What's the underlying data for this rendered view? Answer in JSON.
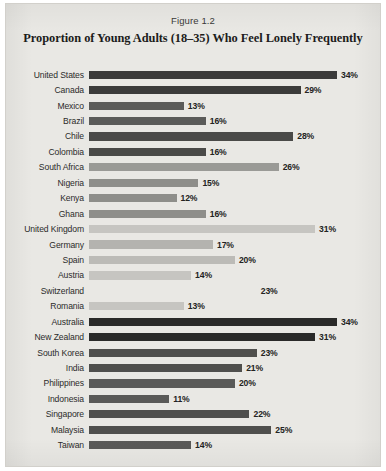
{
  "figure": {
    "number_label": "Figure 1.2",
    "title": "Proportion of Young Adults (18–35) Who Feel Lonely Frequently"
  },
  "chart_data": {
    "type": "bar",
    "orientation": "horizontal",
    "title": "Proportion of Young Adults (18–35) Who Feel Lonely Frequently",
    "subtitle": "Figure 1.2",
    "xlabel": "",
    "ylabel": "",
    "xlim": [
      0,
      34
    ],
    "grid": false,
    "legend": "none",
    "value_suffix": "%",
    "value_labels_shown": true,
    "axis_max_value": 34,
    "categories": [
      "United States",
      "Canada",
      "Mexico",
      "Brazil",
      "Chile",
      "Colombia",
      "South Africa",
      "Nigeria",
      "Kenya",
      "Ghana",
      "United Kingdom",
      "Germany",
      "Spain",
      "Austria",
      "Switzerland",
      "Romania",
      "Australia",
      "New Zealand",
      "South Korea",
      "India",
      "Philippines",
      "Indonesia",
      "Singapore",
      "Malaysia",
      "Taiwan"
    ],
    "values": [
      34,
      29,
      13,
      16,
      28,
      16,
      26,
      15,
      12,
      16,
      31,
      17,
      20,
      14,
      23,
      13,
      34,
      31,
      23,
      21,
      20,
      11,
      22,
      25,
      14
    ],
    "bars": [
      {
        "label": "United States",
        "value": 34,
        "value_text": "34%",
        "shade": "#3b3b3a"
      },
      {
        "label": "Canada",
        "value": 29,
        "value_text": "29%",
        "shade": "#3b3b3a"
      },
      {
        "label": "Mexico",
        "value": 13,
        "value_text": "13%",
        "shade": "#5b5b59"
      },
      {
        "label": "Brazil",
        "value": 16,
        "value_text": "16%",
        "shade": "#5b5b59"
      },
      {
        "label": "Chile",
        "value": 28,
        "value_text": "28%",
        "shade": "#4a4a48"
      },
      {
        "label": "Colombia",
        "value": 16,
        "value_text": "16%",
        "shade": "#4a4a48"
      },
      {
        "label": "South Africa",
        "value": 26,
        "value_text": "26%",
        "shade": "#9a9a96"
      },
      {
        "label": "Nigeria",
        "value": 15,
        "value_text": "15%",
        "shade": "#8e8e8a"
      },
      {
        "label": "Kenya",
        "value": 12,
        "value_text": "12%",
        "shade": "#8e8e8a"
      },
      {
        "label": "Ghana",
        "value": 16,
        "value_text": "16%",
        "shade": "#8e8e8a"
      },
      {
        "label": "United Kingdom",
        "value": 31,
        "value_text": "31%",
        "shade": "#c6c5c1"
      },
      {
        "label": "Germany",
        "value": 17,
        "value_text": "17%",
        "shade": "#b4b3af"
      },
      {
        "label": "Spain",
        "value": 20,
        "value_text": "20%",
        "shade": "#bcbbb7"
      },
      {
        "label": "Austria",
        "value": 14,
        "value_text": "14%",
        "shade": "#c6c5c1"
      },
      {
        "label": "Switzerland",
        "value": 23,
        "value_text": "23%",
        "shade": "#cfcecа"
      },
      {
        "label": "Romania",
        "value": 13,
        "value_text": "13%",
        "shade": "#c6c5c1"
      },
      {
        "label": "Australia",
        "value": 34,
        "value_text": "34%",
        "shade": "#2a2a29"
      },
      {
        "label": "New Zealand",
        "value": 31,
        "value_text": "31%",
        "shade": "#2a2a29"
      },
      {
        "label": "South Korea",
        "value": 23,
        "value_text": "23%",
        "shade": "#4f4f4d"
      },
      {
        "label": "India",
        "value": 21,
        "value_text": "21%",
        "shade": "#4f4f4d"
      },
      {
        "label": "Philippines",
        "value": 20,
        "value_text": "20%",
        "shade": "#5a5a58"
      },
      {
        "label": "Indonesia",
        "value": 11,
        "value_text": "11%",
        "shade": "#5a5a58"
      },
      {
        "label": "Singapore",
        "value": 22,
        "value_text": "22%",
        "shade": "#4f4f4d"
      },
      {
        "label": "Malaysia",
        "value": 25,
        "value_text": "25%",
        "shade": "#4f4f4d"
      },
      {
        "label": "Taiwan",
        "value": 14,
        "value_text": "14%",
        "shade": "#5a5a58"
      }
    ]
  }
}
